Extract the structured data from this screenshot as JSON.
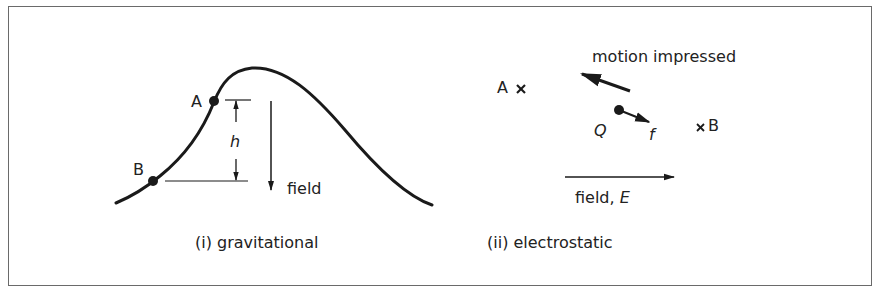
{
  "colors": {
    "ink": "#1a1a1a",
    "frame": "#6a6a6a",
    "background": "#ffffff"
  },
  "panel_i": {
    "caption": "(i) gravitational",
    "point_a": "A",
    "point_b": "B",
    "height_label": "h",
    "field_label": "field"
  },
  "panel_ii": {
    "caption": "(ii) electrostatic",
    "point_a": "A",
    "point_b": "B",
    "charge_label": "Q",
    "force_label": "f",
    "motion_label": "motion impressed",
    "field_label": "field, ",
    "field_symbol": "E"
  }
}
